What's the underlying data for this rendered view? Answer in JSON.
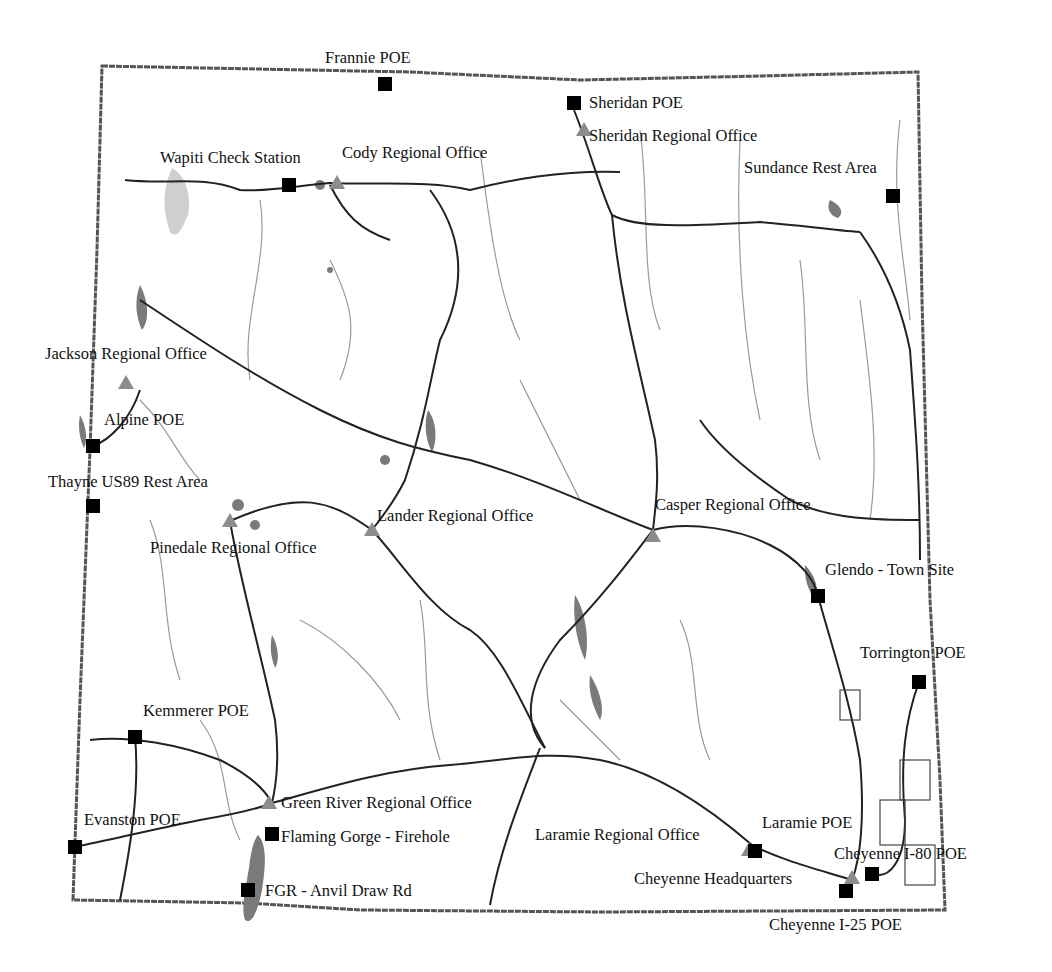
{
  "map": {
    "region": "Wyoming",
    "legend_symbols": {
      "poe_marker": {
        "shape": "square",
        "color": "#000000"
      },
      "office_marker": {
        "shape": "triangle",
        "color": "#8c8c8c"
      }
    },
    "colors": {
      "border": "#555555",
      "major_road": "#222222",
      "minor_road": "#9a9a9a",
      "water": "#7a7a7a"
    },
    "locations": [
      {
        "name": "Frannie POE",
        "type": "poe",
        "x": 385,
        "y": 84,
        "lx": 325,
        "ly": 50
      },
      {
        "name": "Sheridan POE",
        "type": "poe",
        "x": 574,
        "y": 103,
        "lx": 589,
        "ly": 95
      },
      {
        "name": "Sheridan Regional Office",
        "type": "office",
        "x": 584,
        "y": 130,
        "lx": 589,
        "ly": 128
      },
      {
        "name": "Wapiti Check Station",
        "type": "poe",
        "x": 289,
        "y": 185,
        "lx": 160,
        "ly": 150
      },
      {
        "name": "Cody Regional Office",
        "type": "office",
        "x": 337,
        "y": 183,
        "lx": 342,
        "ly": 145
      },
      {
        "name": "Sundance Rest Area",
        "type": "poe",
        "x": 893,
        "y": 196,
        "lx": 744,
        "ly": 160
      },
      {
        "name": "Jackson Regional Office",
        "type": "office",
        "x": 126,
        "y": 383,
        "lx": 45,
        "ly": 346
      },
      {
        "name": "Alpine POE",
        "type": "poe",
        "x": 93,
        "y": 446,
        "lx": 104,
        "ly": 412
      },
      {
        "name": "Thayne US89 Rest Area",
        "type": "poe",
        "x": 93,
        "y": 506,
        "lx": 48,
        "ly": 474
      },
      {
        "name": "Pinedale Regional Office",
        "type": "office",
        "x": 230,
        "y": 521,
        "lx": 150,
        "ly": 540
      },
      {
        "name": "Lander Regional Office",
        "type": "office",
        "x": 372,
        "y": 530,
        "lx": 377,
        "ly": 508
      },
      {
        "name": "Casper Regional Office",
        "type": "office",
        "x": 653,
        "y": 536,
        "lx": 655,
        "ly": 497
      },
      {
        "name": "Glendo - Town Site",
        "type": "poe",
        "x": 818,
        "y": 596,
        "lx": 825,
        "ly": 562
      },
      {
        "name": "Torrington POE",
        "type": "poe",
        "x": 919,
        "y": 682,
        "lx": 860,
        "ly": 645
      },
      {
        "name": "Kemmerer POE",
        "type": "poe",
        "x": 135,
        "y": 737,
        "lx": 143,
        "ly": 703
      },
      {
        "name": "Green River Regional Office",
        "type": "office",
        "x": 269,
        "y": 803,
        "lx": 281,
        "ly": 795
      },
      {
        "name": "Evanston POE",
        "type": "poe",
        "x": 75,
        "y": 847,
        "lx": 84,
        "ly": 812
      },
      {
        "name": "Flaming Gorge - Firehole",
        "type": "poe",
        "x": 272,
        "y": 834,
        "lx": 281,
        "ly": 829
      },
      {
        "name": "FGR - Anvil Draw Rd",
        "type": "poe",
        "x": 248,
        "y": 890,
        "lx": 265,
        "ly": 883
      },
      {
        "name": "Laramie Regional Office",
        "type": "office",
        "x": 749,
        "y": 850,
        "lx": 535,
        "ly": 827
      },
      {
        "name": "Laramie POE",
        "type": "poe",
        "x": 755,
        "y": 851,
        "lx": 762,
        "ly": 815
      },
      {
        "name": "Cheyenne I-80 POE",
        "type": "poe",
        "x": 872,
        "y": 874,
        "lx": 834,
        "ly": 846
      },
      {
        "name": "Cheyenne Headquarters",
        "type": "office",
        "x": 852,
        "y": 878,
        "lx": 634,
        "ly": 871
      },
      {
        "name": "Cheyenne I-25 POE",
        "type": "poe",
        "x": 846,
        "y": 891,
        "lx": 769,
        "ly": 917
      }
    ]
  }
}
